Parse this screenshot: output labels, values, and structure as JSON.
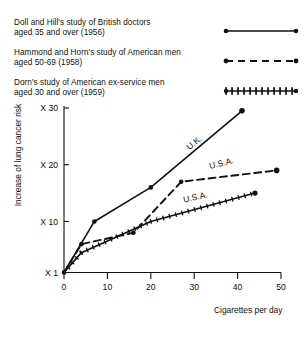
{
  "legend": {
    "entries": [
      {
        "line1": "Doll and Hill's study of British doctors",
        "line2": "aged 35 and over (1956)",
        "sample": "solid-line-with-endpoint-dots",
        "name": "legend-entry-doll-hill"
      },
      {
        "line1": "Hammond and Horn's study of American men",
        "line2": "aged 50-69 (1958)",
        "sample": "dashed-line-with-endpoint-dots",
        "name": "legend-entry-hammond-horn"
      },
      {
        "line1": "Dorn's study of American ex-service men",
        "line2": "aged 30 and over (1959)",
        "sample": "dotted-tick-line",
        "name": "legend-entry-dorn"
      }
    ]
  },
  "chart_data": {
    "type": "line",
    "title": "",
    "xlabel": "Cigarettes per day",
    "ylabel": "Increase of lung cancer risk",
    "xlim": [
      0,
      50
    ],
    "ylim": [
      1,
      30
    ],
    "grid": false,
    "legend_position": "top-right",
    "xticks": [
      0,
      10,
      20,
      30,
      40,
      50
    ],
    "xtick_labels": [
      "0",
      "10",
      "20",
      "30",
      "40",
      "50"
    ],
    "yticks": [
      1,
      10,
      20,
      30
    ],
    "ytick_labels": [
      "X 1",
      "X 10",
      "X 20",
      "X 30"
    ],
    "series": [
      {
        "name": "U.K.",
        "annotation": "U.K.",
        "style": "solid",
        "marker": "dot",
        "study": "Doll and Hill's study of British doctors aged 35 and over (1956)",
        "x": [
          0,
          7,
          20,
          41
        ],
        "y": [
          1,
          10,
          16,
          29.5
        ]
      },
      {
        "name": "U.S.A.",
        "annotation": "U.S.A.",
        "style": "dashed",
        "marker": "dot",
        "study": "Hammond and Horn's study of American men aged 50-69 (1958)",
        "x": [
          0,
          4,
          16,
          27,
          49
        ],
        "y": [
          1,
          6,
          8,
          17,
          19
        ]
      },
      {
        "name": "U.S.A.",
        "annotation": "U.S.A.",
        "style": "solid-ticked",
        "marker": "tick",
        "study": "Dorn's study of American ex-service men aged 30 and over (1959)",
        "x": [
          0,
          4,
          20,
          44
        ],
        "y": [
          1,
          4.5,
          10,
          15
        ]
      }
    ]
  }
}
